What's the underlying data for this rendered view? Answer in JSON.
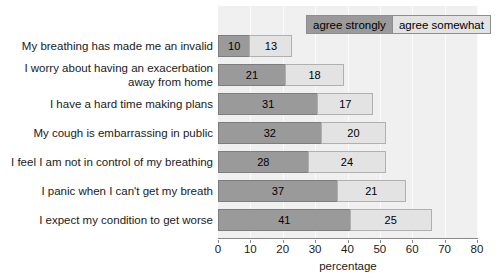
{
  "chart_data": {
    "type": "bar",
    "orientation": "horizontal",
    "stacked": true,
    "title": "",
    "xlabel": "percentage",
    "ylabel": "",
    "xlim": [
      0,
      80
    ],
    "xticks": [
      0,
      10,
      20,
      30,
      40,
      50,
      60,
      70,
      80
    ],
    "grid": true,
    "grid_axis": "x",
    "legend_position": "top-right",
    "categories": [
      "My breathing has made me an invalid",
      "I worry about having an exacerbation away from home",
      "I have a hard time making plans",
      "My cough is embarrassing in public",
      "I feel I am not in control of my breathing",
      "I panic when I can't get my breath",
      "I expect my condition to get worse"
    ],
    "category_lines": [
      [
        "My breathing has made me an invalid"
      ],
      [
        "I worry about having an exacerbation",
        "away from home"
      ],
      [
        "I have a hard time making plans"
      ],
      [
        "My cough is embarrassing in public"
      ],
      [
        "I feel I am not in control of my breathing"
      ],
      [
        "I panic when I can't get my breath"
      ],
      [
        "I expect my condition to get worse"
      ]
    ],
    "series": [
      {
        "name": "agree strongly",
        "color": "#9a9a9a",
        "values": [
          10,
          21,
          31,
          32,
          28,
          37,
          41
        ]
      },
      {
        "name": "agree somewhat",
        "color": "#e3e3e3",
        "values": [
          13,
          18,
          17,
          20,
          24,
          21,
          25
        ]
      }
    ],
    "totals": [
      23,
      39,
      48,
      52,
      52,
      58,
      66
    ]
  },
  "legend": {
    "entries": [
      {
        "label": "agree strongly"
      },
      {
        "label": "agree somewhat"
      }
    ]
  },
  "axis": {
    "x_title": "percentage",
    "tick_labels": [
      "0",
      "10",
      "20",
      "30",
      "40",
      "50",
      "60",
      "70",
      "80"
    ]
  },
  "colors": {
    "agree_strongly": "#9a9a9a",
    "agree_somewhat": "#e3e3e3",
    "plot_background": "#f0f0f0",
    "gridline": "#fbfbfb",
    "axis": "#8a8a8a",
    "page_background": "#ffffff"
  }
}
